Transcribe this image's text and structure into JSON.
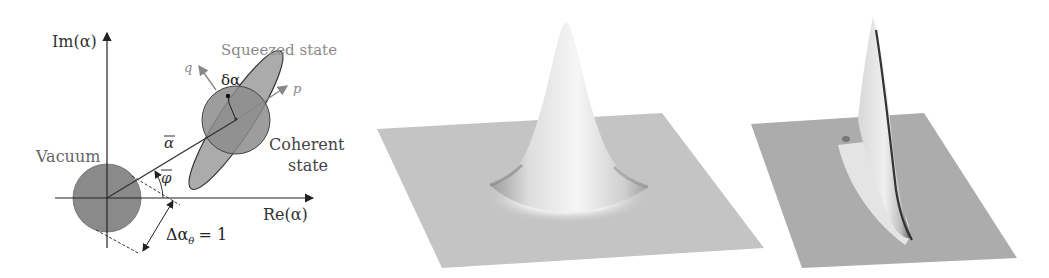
{
  "phase_space_diagram": {
    "axes": {
      "imag_label": "Im(α)",
      "real_label": "Re(α)"
    },
    "labels": {
      "squeezed_state": "Squeezed state",
      "coherent_state_line1": "Coherent",
      "coherent_state_line2": "state",
      "vacuum": "Vacuum",
      "q_axis": "q",
      "p_axis": "p",
      "delta_alpha": "δα",
      "alpha_bar": "α",
      "phi_bar": "φ",
      "uncertainty": "Δα",
      "uncertainty_sub": "θ",
      "uncertainty_value": "= 1"
    },
    "colors": {
      "circle_fill": "#8a8a8a",
      "ellipse_fill": "#a8a8a8",
      "line": "#333333",
      "label_gray": "#888888",
      "label_dark": "#333333"
    }
  },
  "wigner_plots": [
    {
      "name": "coherent-state-wigner-function",
      "shape": "gaussian-peak"
    },
    {
      "name": "squeezed-state-wigner-function",
      "shape": "squeezed-ridge"
    }
  ]
}
